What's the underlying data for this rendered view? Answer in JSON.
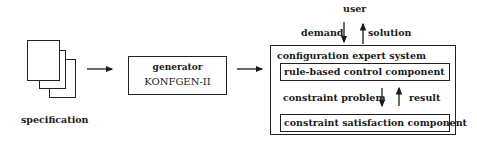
{
  "diagram": {
    "specification": {
      "label": "specification"
    },
    "generator": {
      "line1": "generator",
      "line2": "KONFGEN-II"
    },
    "user": {
      "label": "user",
      "demand_label": "demand",
      "solution_label": "solution"
    },
    "expert_system": {
      "title": "configuration expert system",
      "rule_component": "rule-based control component",
      "constraint_problem_label": "constraint problem",
      "result_label": "result",
      "cs_component": "constraint satisfaction component"
    },
    "edges": [
      {
        "from": "specification",
        "to": "generator"
      },
      {
        "from": "generator",
        "to": "configuration expert system"
      },
      {
        "from": "user",
        "to": "configuration expert system",
        "label": "demand"
      },
      {
        "from": "configuration expert system",
        "to": "user",
        "label": "solution"
      },
      {
        "from": "rule-based control component",
        "to": "constraint satisfaction component",
        "label": "constraint problem"
      },
      {
        "from": "constraint satisfaction component",
        "to": "rule-based control component",
        "label": "result"
      }
    ]
  }
}
